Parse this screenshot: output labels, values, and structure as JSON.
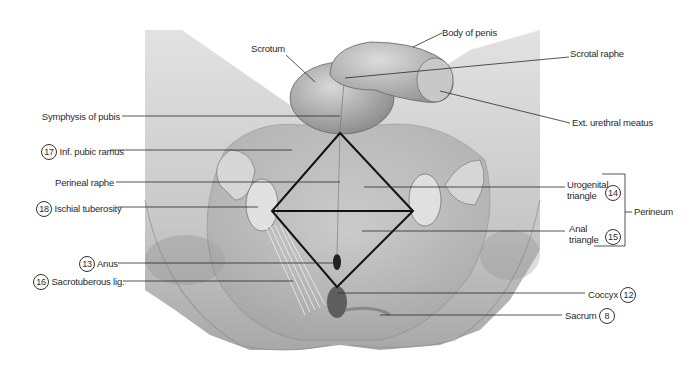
{
  "figure": {
    "labels_left": [
      {
        "id": "symphysis",
        "text": "Symphysis of pubis",
        "number": null
      },
      {
        "id": "inf-pubic-ramus",
        "text": "Inf. pubic ramus",
        "number": "17"
      },
      {
        "id": "perineal-raphe",
        "text": "Perineal raphe",
        "number": null
      },
      {
        "id": "ischial-tuberosity",
        "text": "Ischial tuberosity",
        "number": "18"
      },
      {
        "id": "anus",
        "text": "Anus",
        "number": "13"
      },
      {
        "id": "sacrotuberous",
        "text": "Sacrotuberous lig.",
        "number": "16"
      }
    ],
    "labels_top": [
      {
        "id": "scrotum",
        "text": "Scrotum"
      },
      {
        "id": "body-of-penis",
        "text": "Body of penis"
      }
    ],
    "labels_right": [
      {
        "id": "scrotal-raphe",
        "text": "Scrotal raphe",
        "number": null
      },
      {
        "id": "ext-urethral-meatus",
        "text": "Ext. urethral meatus",
        "number": null
      },
      {
        "id": "urogenital-triangle",
        "line1": "Urogenital",
        "line2": "triangle",
        "number": "14"
      },
      {
        "id": "anal-triangle",
        "line1": "Anal",
        "line2": "triangle",
        "number": "15"
      },
      {
        "id": "coccyx",
        "text": "Coccyx",
        "number": "12"
      },
      {
        "id": "sacrum",
        "text": "Sacrum",
        "number": "8"
      }
    ],
    "bracket_label": "Perineum",
    "colors": {
      "background": "#ffffff",
      "illustration_light": "#d9d9d9",
      "illustration_mid": "#b3b3b3",
      "illustration_dark": "#6e6e6e",
      "leader_line": "#2a2a2a",
      "diamond": "#111111"
    }
  }
}
